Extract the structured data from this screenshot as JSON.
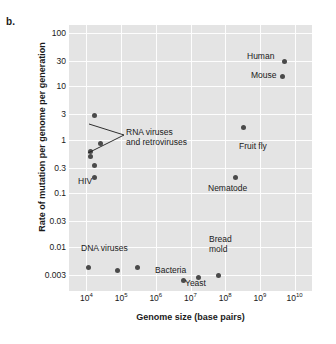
{
  "panel": {
    "label": "b."
  },
  "axes": {
    "x_title": "Genome size (base pairs)",
    "y_title": "Rate of mutation per genome per generation",
    "x_ticks": [
      {
        "mantissa": "10",
        "exponent": "4"
      },
      {
        "mantissa": "10",
        "exponent": "5"
      },
      {
        "mantissa": "10",
        "exponent": "6"
      },
      {
        "mantissa": "10",
        "exponent": "7"
      },
      {
        "mantissa": "10",
        "exponent": "8"
      },
      {
        "mantissa": "10",
        "exponent": "9"
      },
      {
        "mantissa": "10",
        "exponent": "10"
      }
    ],
    "y_ticks": [
      "100",
      "30",
      "10",
      "3",
      "1",
      "0.3",
      "0.1",
      "0.03",
      "0.01",
      "0.003"
    ]
  },
  "annotations": [
    {
      "id": "rna-viruses",
      "line1": "RNA viruses",
      "line2": "and retroviruses"
    },
    {
      "id": "hiv",
      "text": "HIV"
    },
    {
      "id": "dna-viruses",
      "text": "DNA viruses"
    },
    {
      "id": "bacteria",
      "text": "Bacteria"
    },
    {
      "id": "yeast",
      "text": "Yeast"
    },
    {
      "id": "bread-mold",
      "line1": "Bread",
      "line2": "mold"
    },
    {
      "id": "nematode",
      "text": "Nematode"
    },
    {
      "id": "fruit-fly",
      "text": "Fruit fly"
    },
    {
      "id": "mouse",
      "text": "Mouse"
    },
    {
      "id": "human",
      "text": "Human"
    }
  ],
  "colors": {
    "plot_background": "#e4e4e4",
    "gridline": "#fdfdfd",
    "point": "#4a4a4a",
    "text": "#1a1a1a"
  },
  "chart_data": {
    "type": "scatter",
    "title": "",
    "xlabel": "Genome size (base pairs)",
    "ylabel": "Rate of mutation per genome per generation",
    "xscale": "log",
    "yscale": "log",
    "xlim": [
      3162,
      31622776601
    ],
    "ylim": [
      0.0015,
      140
    ],
    "grid": true,
    "legend": "none",
    "points": [
      {
        "label": "RNA virus",
        "x": 17000,
        "y": 2.9
      },
      {
        "label": "RNA virus",
        "x": 26000,
        "y": 0.85
      },
      {
        "label": "RNA virus",
        "x": 13000,
        "y": 0.62
      },
      {
        "label": "RNA virus",
        "x": 13000,
        "y": 0.5
      },
      {
        "label": "RNA virus",
        "x": 17500,
        "y": 0.33
      },
      {
        "label": "HIV",
        "x": 17500,
        "y": 0.2
      },
      {
        "label": "DNA virus",
        "x": 11500,
        "y": 0.0042
      },
      {
        "label": "DNA virus",
        "x": 77000,
        "y": 0.0037
      },
      {
        "label": "DNA virus",
        "x": 300000,
        "y": 0.0041
      },
      {
        "label": "Bacteria",
        "x": 6300000,
        "y": 0.0024
      },
      {
        "label": "Yeast",
        "x": 17000000,
        "y": 0.0027
      },
      {
        "label": "Bread mold",
        "x": 62000000,
        "y": 0.0029
      },
      {
        "label": "Nematode",
        "x": 200000000,
        "y": 0.2
      },
      {
        "label": "Fruit fly",
        "x": 330000000,
        "y": 1.7
      },
      {
        "label": "Mouse",
        "x": 4600000000,
        "y": 15
      },
      {
        "label": "Human",
        "x": 5000000000,
        "y": 29
      }
    ]
  }
}
